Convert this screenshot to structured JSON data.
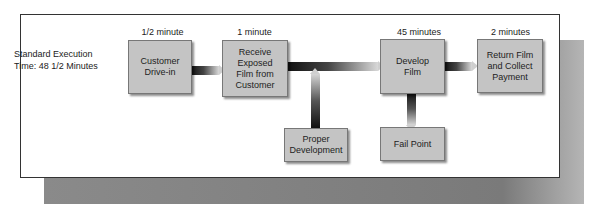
{
  "diagram": {
    "summary": {
      "line1": "Standard Execution",
      "line2": "Time: 48 1/2 Minutes"
    },
    "steps": [
      {
        "id": "customer-drive-in",
        "time": "1/2 minute",
        "label": "Customer Drive-in"
      },
      {
        "id": "receive-film",
        "time": "1 minute",
        "label": "Receive Exposed Film from Customer"
      },
      {
        "id": "develop-film",
        "time": "45 minutes",
        "label": "Develop Film"
      },
      {
        "id": "return-film",
        "time": "2 minutes",
        "label": "Return Film and Collect Payment"
      }
    ],
    "side_nodes": [
      {
        "id": "proper-development",
        "label": "Proper Development",
        "arrow": "up"
      },
      {
        "id": "fail-point",
        "label": "Fail Point",
        "arrow": "down"
      }
    ]
  }
}
